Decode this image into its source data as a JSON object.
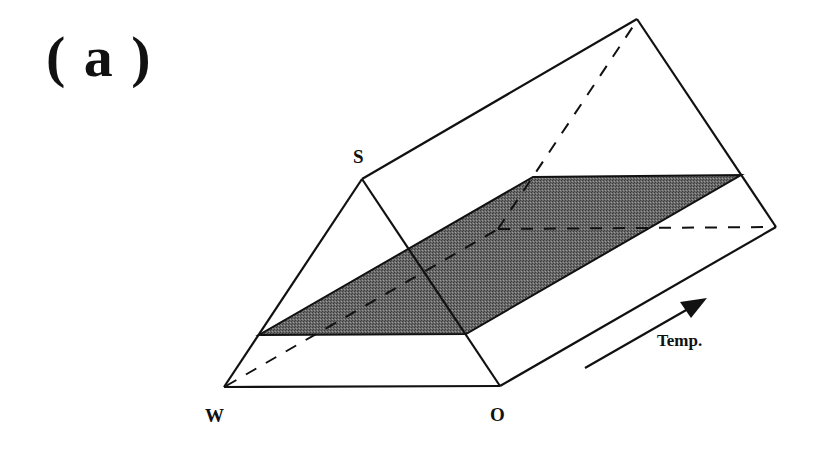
{
  "figure": {
    "panel_label": "( a )",
    "vertices": {
      "S": "S",
      "W": "W",
      "O": "O"
    },
    "axis": {
      "label": "Temp.",
      "icon": "arrow-icon"
    },
    "colors": {
      "line": "#111111",
      "shaded_plane": "#5f5f5f",
      "background": "#ffffff"
    }
  }
}
